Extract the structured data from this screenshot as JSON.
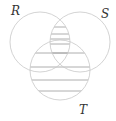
{
  "diagram": {
    "type": "venn",
    "sets": [
      {
        "id": "R",
        "label": "R"
      },
      {
        "id": "S",
        "label": "S"
      },
      {
        "id": "T",
        "label": "T"
      }
    ],
    "shaded_region": "(R ∩ S) ∪ T",
    "shading_style": "horizontal-hatch",
    "colors": {
      "circle_stroke": "#c8c8c8",
      "hatch": "#9a9a9a",
      "label": "#333333"
    }
  }
}
